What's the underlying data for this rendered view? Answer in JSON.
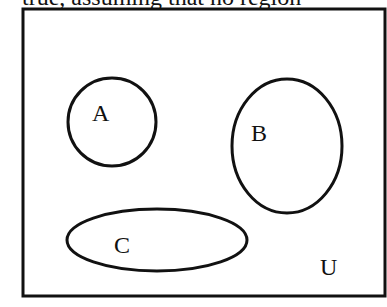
{
  "caption": {
    "text": "true, assuming that no region"
  },
  "diagram": {
    "type": "venn",
    "universe": {
      "label": "U"
    },
    "sets": [
      {
        "label": "A",
        "shape": "circle"
      },
      {
        "label": "B",
        "shape": "ellipse"
      },
      {
        "label": "C",
        "shape": "ellipse"
      }
    ],
    "stroke_color": "#111111",
    "background_color": "#ffffff"
  }
}
